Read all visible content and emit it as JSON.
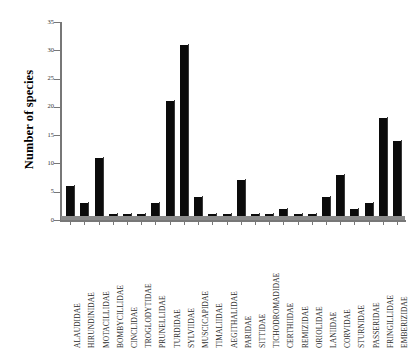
{
  "chart_data": {
    "type": "bar",
    "title": "",
    "subtitle": "",
    "xlabel": "",
    "ylabel": "Number of species",
    "ylim": [
      0,
      35
    ],
    "ytick_values": [
      0,
      5,
      10,
      15,
      20,
      25,
      30,
      35
    ],
    "ytick_labels": [
      "0",
      "5",
      "10",
      "15",
      "20",
      "25",
      "30",
      "35"
    ],
    "grid": false,
    "legend": false,
    "bar_color": "#0b0b0b",
    "axis_color": "#777777",
    "categories": [
      "ALAUDIDAE",
      "HIRUNDINIDAE",
      "MOTACILLIDAE",
      "BOMBYCILLIDAE",
      "CINCLIDAE",
      "TROGLODYTIDAE",
      "PRUNELLIDAE",
      "TURDIDAE",
      "SYLVIIDAE",
      "MUSCICAPIDAE",
      "TIMALIIDAE",
      "AEGITHALIDAE",
      "PARIDAE",
      "SITTIDAE",
      "TICHODROMADIDAE",
      "CERTHIIDAE",
      "REMIZIDAE",
      "ORIOLIDAE",
      "LANIIDAE",
      "CORVIDAE",
      "STURNIDAE",
      "PASSERIDAE",
      "FRINGILLIDAE",
      "EMBERIZIDAE"
    ],
    "values": [
      6,
      3,
      11,
      1,
      1,
      1,
      3,
      21,
      31,
      4,
      1,
      1,
      7,
      1,
      1,
      2,
      1,
      1,
      4,
      8,
      2,
      3,
      18,
      14
    ]
  }
}
